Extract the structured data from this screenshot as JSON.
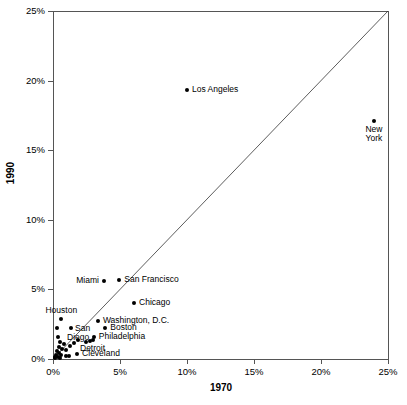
{
  "chart_data": {
    "type": "scatter",
    "title": "",
    "xlabel": "1970",
    "ylabel": "1990",
    "xlim": [
      0,
      25
    ],
    "ylim": [
      0,
      25
    ],
    "xticks": [
      "0%",
      "5%",
      "10%",
      "15%",
      "20%",
      "25%"
    ],
    "yticks": [
      "0%",
      "5%",
      "10%",
      "15%",
      "20%",
      "25%"
    ],
    "xtick_values": [
      0,
      5,
      10,
      15,
      20,
      25
    ],
    "ytick_values": [
      0,
      5,
      10,
      15,
      20,
      25
    ],
    "grid": false,
    "legend": "none",
    "annotations": [
      "identity line y = x drawn from (0%,0%) to (25%,25%)"
    ],
    "points": [
      {
        "label": "New York",
        "x": 23.95,
        "y": 17.1,
        "label_pos": "below2"
      },
      {
        "label": "Los Angeles",
        "x": 10.0,
        "y": 19.3,
        "label_pos": "right"
      },
      {
        "label": "San Francisco",
        "x": 4.95,
        "y": 5.65,
        "label_pos": "right"
      },
      {
        "label": "Miami",
        "x": 3.8,
        "y": 5.6,
        "label_pos": "left"
      },
      {
        "label": "Chicago",
        "x": 6.05,
        "y": 4.05,
        "label_pos": "right"
      },
      {
        "label": "Washington, D.C.",
        "x": 3.35,
        "y": 2.7,
        "label_pos": "right"
      },
      {
        "label": "Boston",
        "x": 3.9,
        "y": 2.25,
        "label_pos": "right"
      },
      {
        "label": "Philadelphia",
        "x": 3.05,
        "y": 1.55,
        "label_pos": "right"
      },
      {
        "label": "Houston",
        "x": 0.62,
        "y": 2.85,
        "label_pos": "above"
      },
      {
        "label": "San Diego",
        "x": 1.35,
        "y": 2.25,
        "label_pos": "right2"
      },
      {
        "label": "Detroit",
        "x": 2.95,
        "y": 1.4,
        "label_pos": "below"
      },
      {
        "label": "Cleveland",
        "x": 1.8,
        "y": 0.38,
        "label_pos": "right"
      },
      {
        "label": "",
        "x": 0.32,
        "y": 2.2,
        "label_pos": "none"
      },
      {
        "label": "",
        "x": 0.38,
        "y": 1.55,
        "label_pos": "none"
      },
      {
        "label": "",
        "x": 0.55,
        "y": 1.2,
        "label_pos": "none"
      },
      {
        "label": "",
        "x": 0.82,
        "y": 1.05,
        "label_pos": "none"
      },
      {
        "label": "",
        "x": 0.45,
        "y": 0.88,
        "label_pos": "none"
      },
      {
        "label": "",
        "x": 0.7,
        "y": 0.72,
        "label_pos": "none"
      },
      {
        "label": "",
        "x": 0.95,
        "y": 0.62,
        "label_pos": "none"
      },
      {
        "label": "",
        "x": 1.25,
        "y": 0.9,
        "label_pos": "none"
      },
      {
        "label": "",
        "x": 1.55,
        "y": 1.15,
        "label_pos": "none"
      },
      {
        "label": "",
        "x": 1.85,
        "y": 1.35,
        "label_pos": "none"
      },
      {
        "label": "",
        "x": 0.3,
        "y": 0.55,
        "label_pos": "none"
      },
      {
        "label": "",
        "x": 0.45,
        "y": 0.4,
        "label_pos": "none"
      },
      {
        "label": "",
        "x": 0.6,
        "y": 0.3,
        "label_pos": "none"
      },
      {
        "label": "",
        "x": 0.22,
        "y": 0.3,
        "label_pos": "none"
      },
      {
        "label": "",
        "x": 0.15,
        "y": 0.15,
        "label_pos": "none"
      },
      {
        "label": "",
        "x": 0.35,
        "y": 0.12,
        "label_pos": "none"
      },
      {
        "label": "",
        "x": 0.95,
        "y": 0.22,
        "label_pos": "none"
      },
      {
        "label": "",
        "x": 1.2,
        "y": 0.18,
        "label_pos": "none"
      },
      {
        "label": "",
        "x": 2.45,
        "y": 1.25,
        "label_pos": "none"
      },
      {
        "label": "",
        "x": 2.75,
        "y": 1.3,
        "label_pos": "none"
      },
      {
        "label": "",
        "x": 0.12,
        "y": 0.05,
        "label_pos": "none"
      },
      {
        "label": "",
        "x": 0.5,
        "y": 0.05,
        "label_pos": "none"
      }
    ]
  },
  "axes": {
    "x_title": "1970",
    "y_title": "1990"
  },
  "colors": {
    "point": "#000000",
    "axis": "#555555",
    "diagonal": "#333333",
    "background": "#ffffff"
  }
}
